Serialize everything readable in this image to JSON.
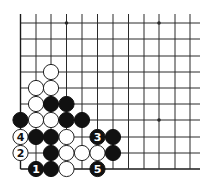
{
  "diagram": {
    "type": "go-board-diagram",
    "grid": {
      "columns": 12,
      "rows": 10,
      "col_x": [
        20.5,
        36,
        51,
        66.5,
        82,
        97.5,
        113,
        128.5,
        144,
        159,
        175,
        190
      ],
      "row_y": [
        23,
        39,
        56,
        72,
        88,
        104,
        120,
        137,
        153,
        169
      ],
      "extend_right_to": 200,
      "extend_top_to": 14,
      "left_edge": true,
      "bottom_edge": true
    },
    "star_points": [
      {
        "col": 3,
        "row": 0
      },
      {
        "col": 9,
        "row": 0
      },
      {
        "col": 9,
        "row": 6
      }
    ],
    "stones": [
      {
        "color": "white",
        "col": 2,
        "row": 3,
        "label": ""
      },
      {
        "color": "white",
        "col": 1,
        "row": 4,
        "label": ""
      },
      {
        "color": "white",
        "col": 2,
        "row": 4,
        "label": ""
      },
      {
        "color": "white",
        "col": 1,
        "row": 5,
        "label": ""
      },
      {
        "color": "black",
        "col": 2,
        "row": 5,
        "label": ""
      },
      {
        "color": "black",
        "col": 3,
        "row": 5,
        "label": ""
      },
      {
        "color": "black",
        "col": 0,
        "row": 6,
        "label": ""
      },
      {
        "color": "white",
        "col": 1,
        "row": 6,
        "label": ""
      },
      {
        "color": "white",
        "col": 2,
        "row": 6,
        "label": ""
      },
      {
        "color": "black",
        "col": 3,
        "row": 6,
        "label": ""
      },
      {
        "color": "black",
        "col": 4,
        "row": 6,
        "label": ""
      },
      {
        "color": "white",
        "col": 0,
        "row": 7,
        "label": "4"
      },
      {
        "color": "black",
        "col": 1,
        "row": 7,
        "label": ""
      },
      {
        "color": "black",
        "col": 2,
        "row": 7,
        "label": ""
      },
      {
        "color": "white",
        "col": 3,
        "row": 7,
        "label": ""
      },
      {
        "color": "black",
        "col": 5,
        "row": 7,
        "label": "3"
      },
      {
        "color": "black",
        "col": 6,
        "row": 7,
        "label": ""
      },
      {
        "color": "white",
        "col": 0,
        "row": 8,
        "label": "2"
      },
      {
        "color": "black",
        "col": 2,
        "row": 8,
        "label": ""
      },
      {
        "color": "white",
        "col": 3,
        "row": 8,
        "label": ""
      },
      {
        "color": "white",
        "col": 4,
        "row": 8,
        "label": ""
      },
      {
        "color": "white",
        "col": 5,
        "row": 8,
        "label": ""
      },
      {
        "color": "black",
        "col": 6,
        "row": 8,
        "label": ""
      },
      {
        "color": "black",
        "col": 1,
        "row": 9,
        "label": "1"
      },
      {
        "color": "black",
        "col": 2,
        "row": 9,
        "label": ""
      },
      {
        "color": "white",
        "col": 3,
        "row": 9,
        "label": ""
      },
      {
        "color": "black",
        "col": 5,
        "row": 9,
        "label": "5"
      }
    ],
    "move_sequence": [
      {
        "move": "1",
        "color": "black"
      },
      {
        "move": "2",
        "color": "white"
      },
      {
        "move": "3",
        "color": "black"
      },
      {
        "move": "4",
        "color": "white"
      },
      {
        "move": "5",
        "color": "black"
      }
    ],
    "colors": {
      "background": "#ffffff",
      "line": "#2a2a2a",
      "black_stone": "#111111",
      "white_stone": "#ffffff"
    },
    "stone_radius": 7.6
  }
}
